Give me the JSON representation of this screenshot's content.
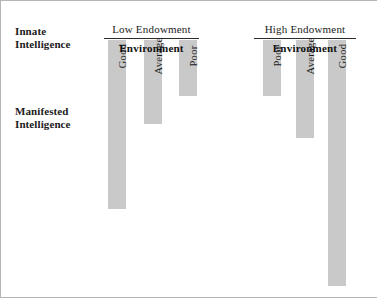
{
  "axis_labels": {
    "innate": "Innate\nIntelligence",
    "manifested": "Manifested\nIntelligence"
  },
  "groups": [
    {
      "header": "Low Endowment",
      "environment_label": "Environment",
      "left": 103,
      "width": 95,
      "bars": [
        {
          "label": "Good",
          "left": 4,
          "height": 169
        },
        {
          "label": "Average",
          "left": 40,
          "height": 84
        },
        {
          "label": "Poor",
          "left": 75,
          "height": 56
        }
      ]
    },
    {
      "header": "High Endowment",
      "environment_label": "Environment",
      "left": 253,
      "width": 102,
      "bars": [
        {
          "label": "Poor",
          "left": 9,
          "height": 56
        },
        {
          "label": "Average",
          "left": 42,
          "height": 98
        },
        {
          "label": "Good",
          "left": 74,
          "height": 246
        }
      ]
    }
  ],
  "colors": {
    "bar_fill": "#c9c9c9",
    "rule": "#2b2b2b",
    "text": "#1b1b1b",
    "border": "#b5b5b5"
  }
}
